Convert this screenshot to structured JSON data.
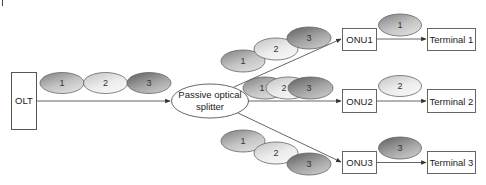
{
  "diagram": {
    "type": "passive-optical-network-downstream-broadcast",
    "olt": {
      "label": "OLT"
    },
    "splitter": {
      "line1": "Passive optical",
      "line2": "splitter"
    },
    "input_packets": [
      "1",
      "2",
      "3"
    ],
    "branches": [
      {
        "onu": "ONU1",
        "terminal": "Terminal 1",
        "packets_in": [
          "1",
          "2",
          "3"
        ],
        "packet_out": "1"
      },
      {
        "onu": "ONU2",
        "terminal": "Terminal 2",
        "packets_in": [
          "1",
          "2",
          "3"
        ],
        "packet_out": "2"
      },
      {
        "onu": "ONU3",
        "terminal": "Terminal 3",
        "packets_in": [
          "1",
          "2",
          "3"
        ],
        "packet_out": "3"
      }
    ],
    "colors": {
      "stroke": "#555555",
      "packet1": [
        "#8f8f8f",
        "#d6d6d6"
      ],
      "packet2": [
        "#c9c9c9",
        "#f4f4f4"
      ],
      "packet3": [
        "#6e6e6e",
        "#bcbcbc"
      ]
    }
  }
}
